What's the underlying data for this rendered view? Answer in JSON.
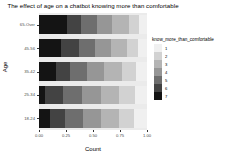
{
  "chart_data": {
    "type": "bar",
    "orientation": "horizontal",
    "stacked": true,
    "normalized": true,
    "title": "The effect of age on a chatbot knowing more than comfortable",
    "xlabel": "Count",
    "ylabel": "Age",
    "xlim": [
      0,
      1
    ],
    "xticks": [
      "0.00",
      "0.25",
      "0.50",
      "0.75",
      "1.00"
    ],
    "xtick_values": [
      0,
      0.25,
      0.5,
      0.75,
      1
    ],
    "grid": false,
    "panel_background": "#ebebeb",
    "legend": {
      "title": "know_more_than_comfortable",
      "position": "right",
      "entries": [
        {
          "label": "1",
          "color": "#f0f0f0"
        },
        {
          "label": "2",
          "color": "#d2d2d2"
        },
        {
          "label": "3",
          "color": "#b4b4b4"
        },
        {
          "label": "4",
          "color": "#969696"
        },
        {
          "label": "5",
          "color": "#6e6e6e"
        },
        {
          "label": "6",
          "color": "#434343"
        },
        {
          "label": "7",
          "color": "#141414"
        }
      ]
    },
    "categories": [
      "65-Over",
      "45-56",
      "35-42",
      "25-34",
      "18-24"
    ],
    "series": [
      {
        "name": "7",
        "color": "#141414",
        "values": [
          0.26,
          0.2,
          0.155,
          0.055,
          0.105
        ]
      },
      {
        "name": "6",
        "color": "#434343",
        "values": [
          0.13,
          0.17,
          0.135,
          0.165,
          0.135
        ]
      },
      {
        "name": "5",
        "color": "#6e6e6e",
        "values": [
          0.145,
          0.145,
          0.15,
          0.18,
          0.17
        ]
      },
      {
        "name": "4",
        "color": "#969696",
        "values": [
          0.145,
          0.15,
          0.16,
          0.17,
          0.165
        ]
      },
      {
        "name": "3",
        "color": "#b4b4b4",
        "values": [
          0.155,
          0.15,
          0.165,
          0.17,
          0.165
        ]
      },
      {
        "name": "2",
        "color": "#d2d2d2",
        "values": [
          0.095,
          0.105,
          0.135,
          0.145,
          0.14
        ]
      },
      {
        "name": "1",
        "color": "#f0f0f0",
        "values": [
          0.07,
          0.08,
          0.1,
          0.115,
          0.12
        ]
      }
    ]
  }
}
